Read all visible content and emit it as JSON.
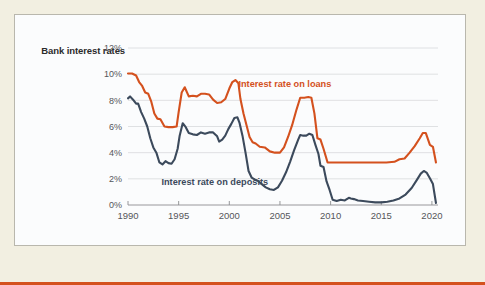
{
  "chart_data": {
    "type": "line",
    "title": "Bank interest rates",
    "xlabel": "",
    "ylabel": "",
    "xlim": [
      1990,
      2020.6
    ],
    "ylim": [
      0,
      12
    ],
    "grid": true,
    "grid_axis": "y",
    "legend_position": "inline-annotations",
    "ytick_labels": [
      "12%",
      "10%",
      "8%",
      "6%",
      "4%",
      "2%",
      "0%"
    ],
    "ytick_values": [
      12,
      10,
      8,
      6,
      4,
      2,
      0
    ],
    "xtick_labels": [
      "1990",
      "1995",
      "2000",
      "2005",
      "2010",
      "2015",
      "2020"
    ],
    "xtick_values": [
      1990,
      1995,
      2000,
      2005,
      2010,
      2015,
      2020
    ],
    "colors": {
      "loans": "#d4511e",
      "deposits": "#3c4a5c",
      "grid": "#d8d9dc",
      "axis": "#8c8d90",
      "panel_background": "#fbfcfd",
      "page_background": "#f2efe1",
      "panel_border": "#b9b7ad",
      "bottom_rule": "#d4511e",
      "title_text": "#2b2b2b",
      "tick_text": "#55565a"
    },
    "annotations": [
      {
        "name": "loans-label",
        "text": "Interest rate on loans",
        "x": 2000.9,
        "y": 9.05,
        "color": "#d4511e"
      },
      {
        "name": "deposits-label",
        "text": "Interest rate on deposits",
        "x": 1993.3,
        "y": 1.55,
        "color": "#3c4a5c"
      }
    ],
    "series": [
      {
        "name": "Interest rate on loans",
        "color": "#d4511e",
        "x": [
          1990.0,
          1990.4,
          1990.8,
          1991.1,
          1991.4,
          1991.7,
          1992.0,
          1992.3,
          1992.6,
          1992.9,
          1993.2,
          1993.6,
          1994.0,
          1994.4,
          1994.8,
          1995.0,
          1995.3,
          1995.6,
          1996.0,
          1996.4,
          1996.8,
          1997.2,
          1997.6,
          1998.0,
          1998.4,
          1998.8,
          1999.2,
          1999.6,
          2000.0,
          2000.3,
          2000.6,
          2000.9,
          2001.1,
          2001.4,
          2001.7,
          2002.0,
          2002.3,
          2002.6,
          2003.0,
          2003.5,
          2004.0,
          2004.5,
          2005.0,
          2005.4,
          2005.8,
          2006.2,
          2006.6,
          2007.0,
          2007.4,
          2007.8,
          2008.1,
          2008.4,
          2008.7,
          2009.0,
          2009.3,
          2009.7,
          2010.5,
          2011.5,
          2012.5,
          2013.5,
          2014.5,
          2015.5,
          2016.3,
          2016.8,
          2017.3,
          2017.8,
          2018.3,
          2018.8,
          2019.1,
          2019.4,
          2019.8,
          2020.1,
          2020.4
        ],
        "y": [
          10.05,
          10.05,
          9.9,
          9.4,
          9.1,
          8.6,
          8.5,
          7.9,
          7.0,
          6.6,
          6.55,
          6.0,
          5.95,
          5.95,
          6.0,
          7.1,
          8.6,
          9.0,
          8.3,
          8.35,
          8.3,
          8.5,
          8.5,
          8.45,
          8.05,
          7.8,
          7.85,
          8.1,
          8.9,
          9.4,
          9.55,
          9.3,
          8.1,
          7.0,
          6.1,
          5.2,
          4.8,
          4.7,
          4.45,
          4.4,
          4.1,
          4.0,
          4.0,
          4.4,
          5.2,
          6.1,
          7.2,
          8.2,
          8.2,
          8.25,
          8.2,
          7.0,
          5.1,
          5.0,
          4.3,
          3.25,
          3.25,
          3.25,
          3.25,
          3.25,
          3.25,
          3.25,
          3.3,
          3.5,
          3.55,
          4.0,
          4.5,
          5.1,
          5.5,
          5.5,
          4.6,
          4.45,
          3.25
        ]
      },
      {
        "name": "Interest rate on deposits",
        "color": "#3c4a5c",
        "x": [
          1990.0,
          1990.2,
          1990.5,
          1990.8,
          1991.0,
          1991.3,
          1991.6,
          1991.9,
          1992.2,
          1992.5,
          1992.8,
          1993.1,
          1993.4,
          1993.7,
          1994.0,
          1994.3,
          1994.6,
          1994.9,
          1995.1,
          1995.4,
          1995.7,
          1996.0,
          1996.4,
          1996.8,
          1997.2,
          1997.6,
          1998.0,
          1998.4,
          1998.8,
          1999.0,
          1999.3,
          1999.6,
          1999.9,
          2000.2,
          2000.5,
          2000.8,
          2001.0,
          2001.3,
          2001.6,
          2001.9,
          2002.2,
          2002.5,
          2002.8,
          2003.2,
          2003.6,
          2004.0,
          2004.4,
          2004.8,
          2005.2,
          2005.6,
          2006.0,
          2006.4,
          2006.8,
          2007.0,
          2007.3,
          2007.6,
          2007.9,
          2008.2,
          2008.5,
          2008.8,
          2009.0,
          2009.3,
          2009.6,
          2009.9,
          2010.2,
          2010.6,
          2011.0,
          2011.4,
          2011.8,
          2012.0,
          2012.3,
          2012.7,
          2013.2,
          2013.8,
          2014.4,
          2015.0,
          2015.6,
          2016.2,
          2016.8,
          2017.4,
          2018.0,
          2018.5,
          2018.9,
          2019.2,
          2019.5,
          2019.8,
          2020.1,
          2020.4
        ],
        "y": [
          8.15,
          8.3,
          8.05,
          7.75,
          7.75,
          7.1,
          6.6,
          6.0,
          5.1,
          4.4,
          4.0,
          3.25,
          3.1,
          3.35,
          3.2,
          3.15,
          3.5,
          4.3,
          5.3,
          6.25,
          5.95,
          5.5,
          5.4,
          5.35,
          5.55,
          5.45,
          5.55,
          5.55,
          5.25,
          4.85,
          5.0,
          5.3,
          5.8,
          6.2,
          6.65,
          6.7,
          6.3,
          5.3,
          4.0,
          2.6,
          2.1,
          1.95,
          1.85,
          1.6,
          1.35,
          1.2,
          1.15,
          1.35,
          1.85,
          2.5,
          3.3,
          4.2,
          5.0,
          5.35,
          5.3,
          5.3,
          5.45,
          5.35,
          4.6,
          3.9,
          3.0,
          2.9,
          1.8,
          1.15,
          0.4,
          0.3,
          0.4,
          0.35,
          0.55,
          0.5,
          0.45,
          0.35,
          0.3,
          0.25,
          0.2,
          0.2,
          0.25,
          0.35,
          0.5,
          0.8,
          1.3,
          1.9,
          2.4,
          2.6,
          2.45,
          2.05,
          1.6,
          0.15
        ]
      }
    ]
  }
}
